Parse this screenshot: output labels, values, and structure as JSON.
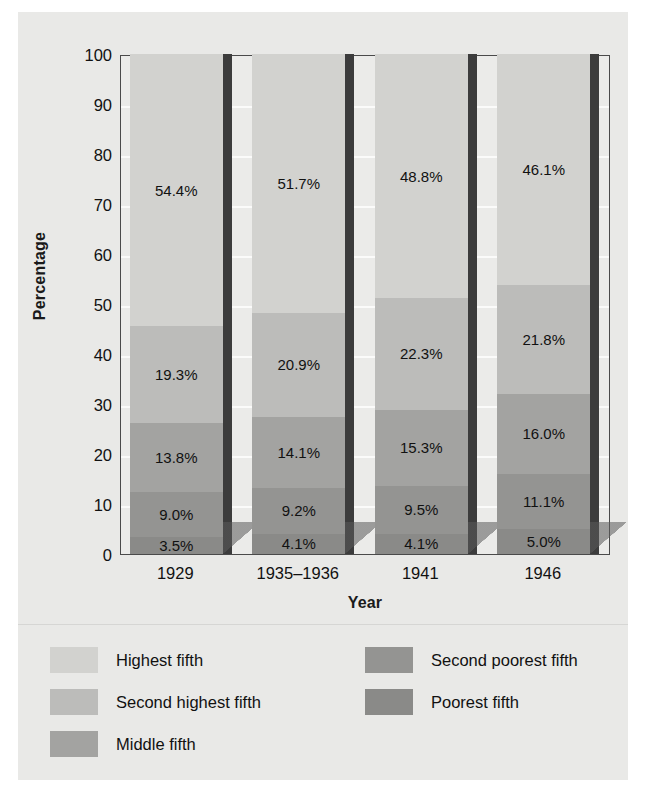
{
  "chart_data": {
    "type": "bar",
    "subtype": "stacked-bar-100",
    "title": "",
    "xlabel": "Year",
    "ylabel": "Percentage",
    "ylim": [
      0,
      100
    ],
    "yticks": [
      0,
      10,
      20,
      30,
      40,
      50,
      60,
      70,
      80,
      90,
      100
    ],
    "grid": true,
    "legend_position": "bottom",
    "categories": [
      "1929",
      "1935–1936",
      "1941",
      "1946"
    ],
    "series": [
      {
        "name": "Highest fifth",
        "color": "#d2d2cf",
        "values": [
          54.4,
          51.7,
          48.8,
          46.1
        ],
        "labels": [
          "54.4%",
          "51.7%",
          "48.8%",
          "46.1%"
        ]
      },
      {
        "name": "Second highest fifth",
        "color": "#bcbcba",
        "values": [
          19.3,
          20.9,
          22.3,
          21.8
        ],
        "labels": [
          "19.3%",
          "20.9%",
          "22.3%",
          "21.8%"
        ]
      },
      {
        "name": "Middle fifth",
        "color": "#a3a3a1",
        "values": [
          13.8,
          14.1,
          15.3,
          16.0
        ],
        "labels": [
          "13.8%",
          "14.1%",
          "15.3%",
          "16.0%"
        ]
      },
      {
        "name": "Second poorest fifth",
        "color": "#949492",
        "values": [
          9.0,
          9.2,
          9.5,
          11.1
        ],
        "labels": [
          "9.0%",
          "9.2%",
          "9.5%",
          "11.1%"
        ]
      },
      {
        "name": "Poorest fifth",
        "color": "#8a8a88",
        "values": [
          3.5,
          4.1,
          4.1,
          5.0
        ],
        "labels": [
          "3.5%",
          "4.1%",
          "4.1%",
          "5.0%"
        ]
      }
    ]
  },
  "axes": {
    "y_title": "Percentage",
    "x_title": "Year",
    "y_tick_labels": [
      "100",
      "90",
      "80",
      "70",
      "60",
      "50",
      "40",
      "30",
      "20",
      "10",
      "0"
    ],
    "x_tick_labels": [
      "1929",
      "1935–1936",
      "1941",
      "1946"
    ]
  },
  "legend": {
    "column_left": [
      {
        "label": "Highest fifth",
        "color": "#d2d2cf"
      },
      {
        "label": "Second highest fifth",
        "color": "#bcbcba"
      },
      {
        "label": "Middle fifth",
        "color": "#a3a3a1"
      }
    ],
    "column_right": [
      {
        "label": "Second poorest fifth",
        "color": "#949492"
      },
      {
        "label": "Poorest fifth",
        "color": "#8a8a88"
      }
    ]
  },
  "colors": {
    "figure_background": "#e9e9e7",
    "plot_background": "#ebebe9",
    "plot_border": "#4a4a4a",
    "gridline": "#fbfbfa",
    "bar_side_face": "#3c3c3c",
    "text": "#111111"
  }
}
